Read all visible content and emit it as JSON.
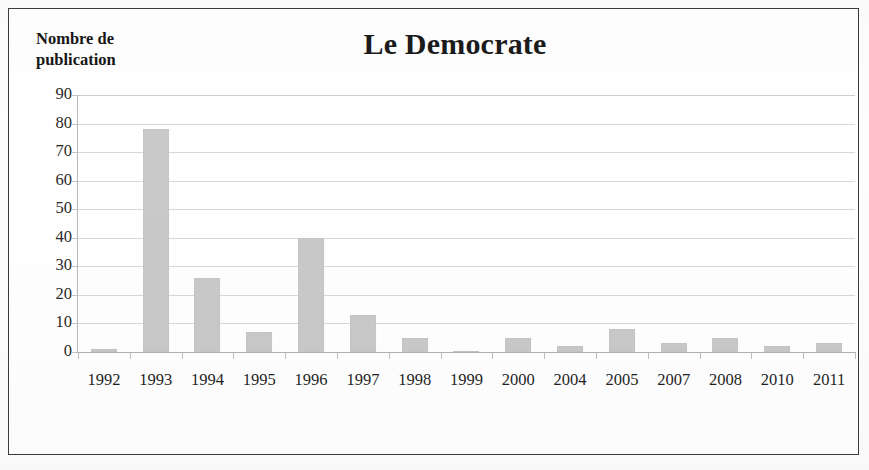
{
  "figure": {
    "title": "Le Democrate",
    "y_axis_title_line1": "Nombre de",
    "y_axis_title_line2": "publication",
    "x_axis_title": "Année",
    "bar_color": "#c9c9c9",
    "gridline_color": "#d8d8d8",
    "axis_color": "#b9b9b9",
    "frame_color": "#3c3c3c"
  },
  "chart_data": {
    "type": "bar",
    "title": "Le Democrate",
    "xlabel": "Année",
    "ylabel": "Nombre de publication",
    "ylim": [
      0,
      90
    ],
    "ytick_step": 10,
    "yticks": [
      90,
      80,
      70,
      60,
      50,
      40,
      30,
      20,
      10,
      0
    ],
    "grid": true,
    "legend": "none",
    "categories": [
      "1992",
      "1993",
      "1994",
      "1995",
      "1996",
      "1997",
      "1998",
      "1999",
      "2000",
      "2004",
      "2005",
      "2007",
      "2008",
      "2010",
      "2011"
    ],
    "values": [
      1,
      78,
      26,
      7,
      40,
      13,
      5,
      0.5,
      5,
      2,
      8,
      3,
      5,
      2,
      3
    ],
    "series": [
      {
        "name": "Nombre de publication",
        "values": [
          1,
          78,
          26,
          7,
          40,
          13,
          5,
          0.5,
          5,
          2,
          8,
          3,
          5,
          2,
          3
        ]
      }
    ]
  }
}
